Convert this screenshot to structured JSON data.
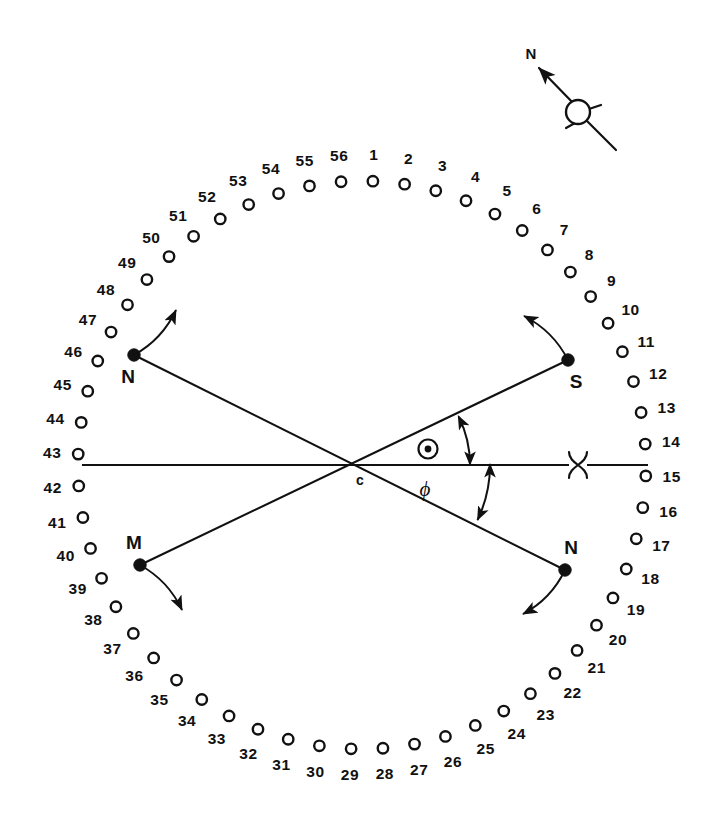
{
  "figure": {
    "center_label": "c",
    "phi_label": "ϕ",
    "hole_count": 56,
    "ring": {
      "center_x": 362,
      "center_y": 465,
      "radius": 284,
      "hole_radius": 5.2,
      "label_offset": 26,
      "start_angle_deg": -87.8,
      "step_deg": 6.4285714
    },
    "hole_numbers": [
      "1",
      "2",
      "3",
      "4",
      "5",
      "6",
      "7",
      "8",
      "9",
      "10",
      "11",
      "12",
      "13",
      "14",
      "15",
      "16",
      "17",
      "18",
      "19",
      "20",
      "21",
      "22",
      "23",
      "24",
      "25",
      "26",
      "27",
      "28",
      "29",
      "30",
      "31",
      "32",
      "33",
      "34",
      "35",
      "36",
      "37",
      "38",
      "39",
      "40",
      "41",
      "42",
      "43",
      "44",
      "45",
      "46",
      "47",
      "48",
      "49",
      "50",
      "51",
      "52",
      "53",
      "54",
      "55",
      "56"
    ],
    "markers": [
      {
        "id": "marker-n-upper-left",
        "label": "N",
        "x": 134,
        "y": 355,
        "label_dx": -6,
        "label_dy": 28,
        "arrow_dx": 42,
        "arrow_dy": -45,
        "arrow_bow": 10
      },
      {
        "id": "marker-s-upper-right",
        "label": "S",
        "x": 568,
        "y": 360,
        "label_dx": 8,
        "label_dy": 28,
        "arrow_dx": -44,
        "arrow_dy": -44,
        "arrow_bow": 10
      },
      {
        "id": "marker-m-lower-left",
        "label": "M",
        "x": 140,
        "y": 565,
        "label_dx": -6,
        "label_dy": -16,
        "arrow_dx": 42,
        "arrow_dy": 45,
        "arrow_bow": -10
      },
      {
        "id": "marker-n-lower-right",
        "label": "N",
        "x": 565,
        "y": 570,
        "label_dx": 6,
        "label_dy": -16,
        "arrow_dx": -42,
        "arrow_dy": 44,
        "arrow_bow": -10
      }
    ],
    "chords": [
      {
        "id": "chord-n-to-n",
        "x1": 134,
        "y1": 355,
        "x2": 565,
        "y2": 570
      },
      {
        "id": "chord-m-to-s",
        "x1": 140,
        "y1": 565,
        "x2": 568,
        "y2": 360
      }
    ],
    "axis": {
      "id": "horizontal-axis",
      "x1": 82,
      "y1": 465,
      "x2": 648,
      "y2": 465
    },
    "sun_symbol": {
      "x": 428,
      "y": 449,
      "outer_r": 9.5,
      "inner_r": 3.4
    },
    "aries_symbol": {
      "x": 578,
      "y": 465
    },
    "angle_arcs": [
      {
        "id": "angle-arc-upper",
        "cx": 362,
        "cy": 465,
        "r": 108,
        "a1_deg": -26.5,
        "a2_deg": 0
      },
      {
        "id": "angle-arc-lower",
        "cx": 362,
        "cy": 465,
        "r": 128,
        "a1_deg": 0,
        "a2_deg": 25.5
      }
    ],
    "phi_position": {
      "x": 425,
      "y": 496
    }
  },
  "compass": {
    "label": "N",
    "label_x": 531,
    "label_y": 59,
    "arrow_from_x": 578,
    "arrow_from_y": 108,
    "arrow_to_x": 539,
    "arrow_to_y": 68,
    "circle_x": 578,
    "circle_y": 112,
    "circle_r": 12,
    "tail_to_x": 616,
    "tail_to_y": 150,
    "spoke_len": 11
  }
}
